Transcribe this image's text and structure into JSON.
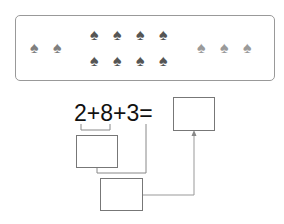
{
  "panel": {
    "groups": [
      {
        "name": "left-group",
        "count": 2,
        "color": "#7f7f7f"
      },
      {
        "name": "middle-group",
        "count": 8,
        "rows": 2,
        "color": "#555555"
      },
      {
        "name": "right-group",
        "count": 3,
        "color": "#9a9a9a"
      }
    ],
    "spade_glyph": "♠"
  },
  "equation": {
    "terms": [
      "2",
      "8",
      "3"
    ],
    "operators": [
      "+",
      "+"
    ],
    "equals": "="
  },
  "answer_boxes": {
    "first_sum": "",
    "second_sum": "",
    "final_result": ""
  }
}
